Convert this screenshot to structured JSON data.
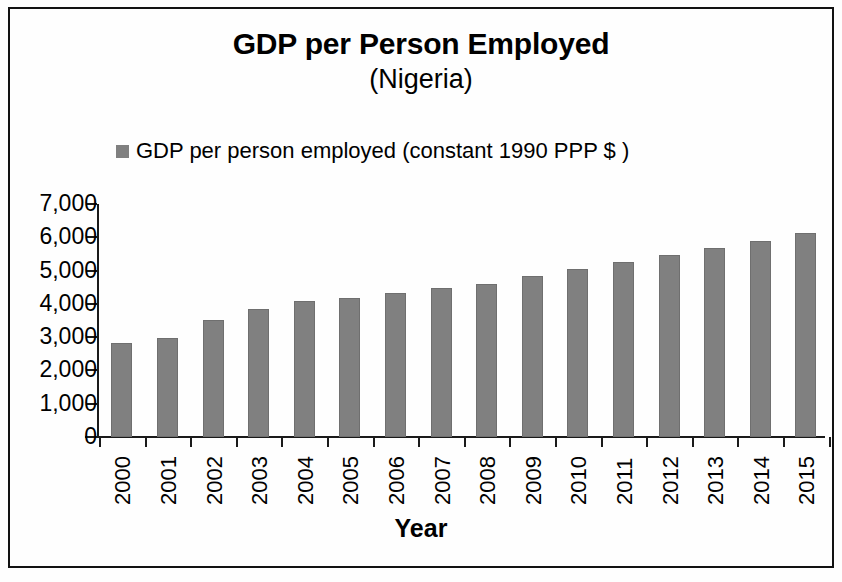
{
  "chart_data": {
    "type": "bar",
    "title": "GDP per Person Employed",
    "subtitle": "(Nigeria)",
    "xlabel": "Year",
    "ylabel": "",
    "legend": [
      {
        "name": "GDP per person employed  (constant 1990 PPP $ )",
        "color": "#808080"
      }
    ],
    "legend_position": "top-left",
    "grid": false,
    "ylim": [
      0,
      7000
    ],
    "ytick_labels": [
      "7,000",
      "6,000",
      "5,000",
      "4,000",
      "3,000",
      "2,000",
      "1,000",
      "0"
    ],
    "ytick_values": [
      7000,
      6000,
      5000,
      4000,
      3000,
      2000,
      1000,
      0
    ],
    "categories": [
      "2000",
      "2001",
      "2002",
      "2003",
      "2004",
      "2005",
      "2006",
      "2007",
      "2008",
      "2009",
      "2010",
      "2011",
      "2012",
      "2013",
      "2014",
      "2015"
    ],
    "values": [
      2820,
      2970,
      3530,
      3840,
      4090,
      4190,
      4320,
      4480,
      4600,
      4830,
      5040,
      5250,
      5470,
      5690,
      5900,
      6130
    ],
    "series": [
      {
        "name": "GDP per person employed  (constant 1990 PPP $ )",
        "color": "#808080",
        "values": [
          2820,
          2970,
          3530,
          3840,
          4090,
          4190,
          4320,
          4480,
          4600,
          4830,
          5040,
          5250,
          5470,
          5690,
          5900,
          6130
        ]
      }
    ]
  },
  "colors": {
    "bar": "#828282",
    "axis": "#1a1a1a",
    "text": "#000000",
    "background": "#ffffff",
    "frame": "#121212"
  }
}
